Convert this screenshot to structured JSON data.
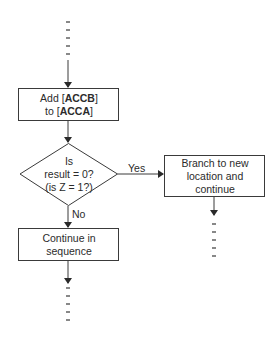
{
  "diagram": {
    "type": "flowchart",
    "stroke_color": "#3a3a3a",
    "background": "#ffffff",
    "nodes": [
      {
        "id": "add",
        "shape": "rectangle",
        "line1_prefix": "Add [",
        "line1_bold": "ACCB",
        "line1_suffix": "]",
        "line2_prefix": "to [",
        "line2_bold": "ACCA",
        "line2_suffix": "]"
      },
      {
        "id": "decision",
        "shape": "diamond",
        "line1": "Is",
        "line2": "result = 0?",
        "line3": "(is Z = 1?)"
      },
      {
        "id": "branch",
        "shape": "rectangle",
        "line1": "Branch to new",
        "line2": "location and",
        "line3": "continue"
      },
      {
        "id": "continue",
        "shape": "rectangle",
        "line1": "Continue in",
        "line2": "sequence"
      }
    ],
    "edges": [
      {
        "from": "start",
        "to": "add",
        "label": ""
      },
      {
        "from": "add",
        "to": "decision",
        "label": ""
      },
      {
        "from": "decision",
        "to": "branch",
        "label": "Yes"
      },
      {
        "from": "decision",
        "to": "continue",
        "label": "No"
      },
      {
        "from": "branch",
        "to": "end-right",
        "label": ""
      },
      {
        "from": "continue",
        "to": "end-left",
        "label": ""
      }
    ],
    "continuation_markers": {
      "top": "dashes",
      "bottom_left": "dashes",
      "bottom_right": "dashes"
    }
  }
}
